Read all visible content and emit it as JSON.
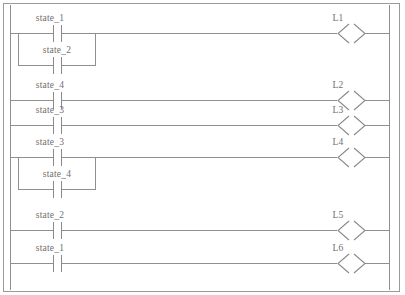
{
  "diagram": {
    "kind": "ladder-logic-diagram",
    "title": "",
    "colors": {
      "background": "#ffffff",
      "wire": "#8f8f8f",
      "frame": "#9a9a9a",
      "text": "#6f6f6f"
    },
    "rails": {
      "left_label": "",
      "right_label": ""
    },
    "rungs": [
      {
        "id": "rung-1",
        "contacts": [
          {
            "label": "state_1",
            "type": "normally-open",
            "branch": "main"
          },
          {
            "label": "state_2",
            "type": "normally-open",
            "branch": "parallel"
          }
        ],
        "coil": {
          "label": "L1",
          "type": "output-coil"
        }
      },
      {
        "id": "rung-2",
        "contacts": [
          {
            "label": "state_4",
            "type": "normally-open",
            "branch": "main"
          }
        ],
        "coil": {
          "label": "L2",
          "type": "output-coil"
        }
      },
      {
        "id": "rung-3",
        "contacts": [
          {
            "label": "state_3",
            "type": "normally-open",
            "branch": "main"
          }
        ],
        "coil": {
          "label": "L3",
          "type": "output-coil"
        }
      },
      {
        "id": "rung-4",
        "contacts": [
          {
            "label": "state_3",
            "type": "normally-open",
            "branch": "main"
          },
          {
            "label": "state_4",
            "type": "normally-open",
            "branch": "parallel"
          }
        ],
        "coil": {
          "label": "L4",
          "type": "output-coil"
        }
      },
      {
        "id": "rung-5",
        "contacts": [
          {
            "label": "state_2",
            "type": "normally-open",
            "branch": "main"
          }
        ],
        "coil": {
          "label": "L5",
          "type": "output-coil"
        }
      },
      {
        "id": "rung-6",
        "contacts": [
          {
            "label": "state_1",
            "type": "normally-open",
            "branch": "main"
          }
        ],
        "coil": {
          "label": "L6",
          "type": "output-coil"
        }
      }
    ],
    "labels": {
      "contact_1_1": "state_1",
      "contact_1_2": "state_2",
      "contact_2_1": "state_4",
      "contact_3_1": "state_3",
      "contact_4_1": "state_3",
      "contact_4_2": "state_4",
      "contact_5_1": "state_2",
      "contact_6_1": "state_1",
      "coil_1": "L1",
      "coil_2": "L2",
      "coil_3": "L3",
      "coil_4": "L4",
      "coil_5": "L5",
      "coil_6": "L6"
    }
  }
}
